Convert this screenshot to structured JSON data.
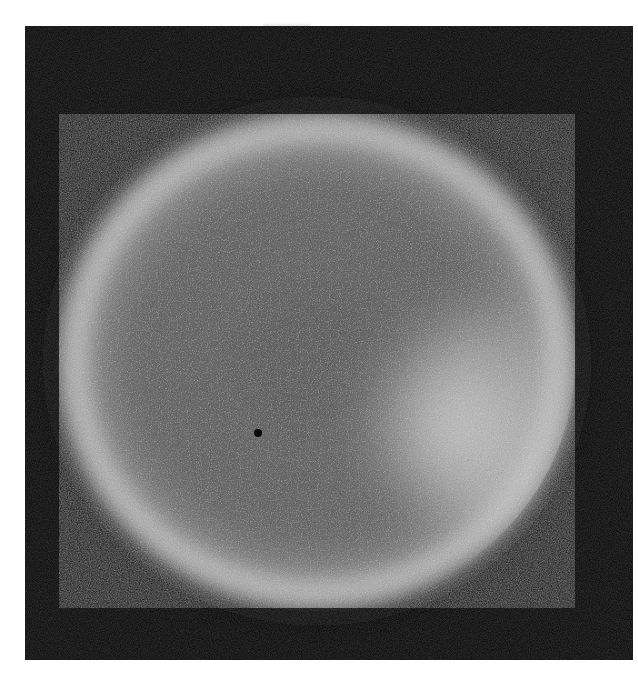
{
  "image": {
    "kind": "grayscale photograph",
    "subject": "glowing spherical body with bright limb",
    "background_color": "#ffffff",
    "frame": {
      "x": 25,
      "y": 26,
      "width": 608,
      "height": 634,
      "color": "#0c0c0c"
    },
    "sphere": {
      "center_x": 292,
      "center_y": 335,
      "radius_x": 258,
      "radius_y": 247,
      "interior_color": "#5a5a5a",
      "rim_color": "#c8c8c8"
    },
    "bright_patch": {
      "center_x": 435,
      "center_y": 400,
      "radius": 110,
      "color": "#d2d2d2"
    },
    "dark_spot": {
      "center_x": 233,
      "center_y": 407,
      "radius": 4,
      "color": "#0a0a0a"
    }
  }
}
